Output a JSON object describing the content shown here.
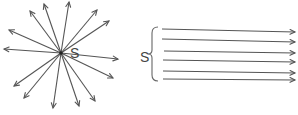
{
  "diagram": {
    "title": "",
    "point_source": {
      "label": "S",
      "center": [
        61,
        53
      ],
      "label_pos": [
        70,
        58
      ],
      "ray_tips": [
        [
          44,
          4
        ],
        [
          30,
          11
        ],
        [
          69,
          2
        ],
        [
          97,
          10
        ],
        [
          109,
          21
        ],
        [
          9,
          30
        ],
        [
          4,
          49
        ],
        [
          118,
          59
        ],
        [
          113,
          78
        ],
        [
          14,
          86
        ],
        [
          24,
          98
        ],
        [
          53,
          108
        ],
        [
          79,
          106
        ],
        [
          95,
          101
        ]
      ]
    },
    "parallel_source": {
      "label": "S",
      "label_pos": [
        140,
        62
      ],
      "brace": {
        "x": 152,
        "top": 27,
        "bottom": 81,
        "mid": 54
      },
      "beams": [
        {
          "x1": 162,
          "y1": 29,
          "x2": 295,
          "y2": 32
        },
        {
          "x1": 162,
          "y1": 39,
          "x2": 295,
          "y2": 42
        },
        {
          "x1": 164,
          "y1": 51,
          "x2": 295,
          "y2": 53
        },
        {
          "x1": 163,
          "y1": 60,
          "x2": 295,
          "y2": 62
        },
        {
          "x1": 163,
          "y1": 71,
          "x2": 295,
          "y2": 73
        },
        {
          "x1": 163,
          "y1": 79,
          "x2": 295,
          "y2": 80
        }
      ]
    },
    "colors": {
      "stroke": "#555555",
      "background": "#ffffff"
    }
  }
}
